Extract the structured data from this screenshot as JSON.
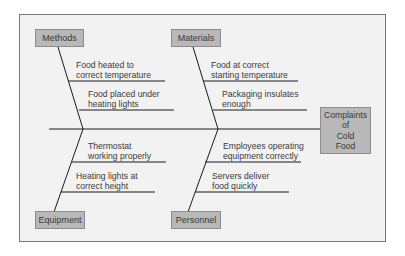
{
  "diagram": {
    "type": "fishbone",
    "effect": {
      "lines": [
        "Complaints",
        "of",
        "Cold",
        "Food"
      ]
    },
    "categories": [
      {
        "name": "Methods",
        "position": "top-left",
        "causes": [
          "Food heated to correct temperature",
          "Food placed under heating lights"
        ],
        "cause_lines": [
          [
            "Food heated to",
            "correct temperature"
          ],
          [
            "Food placed under",
            "heating lights"
          ]
        ]
      },
      {
        "name": "Materials",
        "position": "top-right",
        "causes": [
          "Food at correct starting temperature",
          "Packaging insulates enough"
        ],
        "cause_lines": [
          [
            "Food at correct",
            "starting temperature"
          ],
          [
            "Packaging insulates",
            "enough"
          ]
        ]
      },
      {
        "name": "Equipment",
        "position": "bottom-left",
        "causes": [
          "Thermostat working properly",
          "Heating lights at correct height"
        ],
        "cause_lines": [
          [
            "Thermostat",
            "working properly"
          ],
          [
            "Heating lights at",
            "correct height"
          ]
        ]
      },
      {
        "name": "Personnel",
        "position": "bottom-right",
        "causes": [
          "Employees operating equipment correctly",
          "Servers deliver food quickly"
        ],
        "cause_lines": [
          [
            "Employees operating",
            "equipment correctly"
          ],
          [
            "Servers deliver",
            "food quickly"
          ]
        ]
      }
    ],
    "colors": {
      "box_fill": "#b8b8b8",
      "background": "#f2f2f2",
      "line": "#1a1a1a",
      "text": "#3a3a3a"
    }
  }
}
